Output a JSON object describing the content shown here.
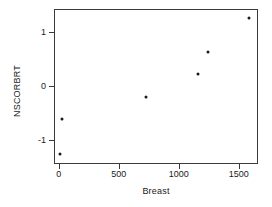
{
  "chart_data": {
    "type": "scatter",
    "title": "",
    "xlabel": "Breast",
    "ylabel": "NSCORBRT",
    "xlim": [
      -40,
      1660
    ],
    "ylim": [
      -1.45,
      1.42
    ],
    "xticks": [
      0,
      500,
      1000,
      1500
    ],
    "xtick_labels": [
      "0",
      "500",
      "1000",
      "1500"
    ],
    "yticks": [
      1,
      0,
      -1
    ],
    "ytick_labels": [
      "1",
      "0",
      "-1"
    ],
    "grid": false,
    "legend": null,
    "marker_color": "#1a1a1a",
    "frame_color": "#3a3a3a",
    "points": [
      {
        "x": 0,
        "y": -1.25
      },
      {
        "x": 17,
        "y": -0.6
      },
      {
        "x": 717,
        "y": -0.2
      },
      {
        "x": 1150,
        "y": 0.24
      },
      {
        "x": 1233,
        "y": 0.64
      },
      {
        "x": 1575,
        "y": 1.27
      }
    ]
  }
}
